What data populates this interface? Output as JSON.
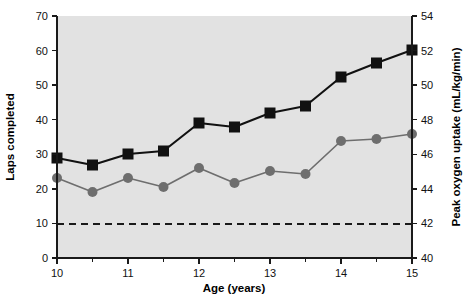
{
  "chart_data": {
    "type": "line",
    "title": "",
    "subtitle": "",
    "xlabel": "Age (years)",
    "ylabel": "Laps completed",
    "y2label": "Peak oxygen uptake (mL/kg/min)",
    "x": [
      10,
      10.5,
      11,
      11.5,
      12,
      12.5,
      13,
      13.5,
      14,
      14.5,
      15
    ],
    "xlim": [
      10,
      15
    ],
    "ylim": [
      0,
      70
    ],
    "y2lim": [
      40,
      54
    ],
    "xticks": [
      10,
      11,
      12,
      13,
      14,
      15
    ],
    "xticklabels": [
      "10",
      "11",
      "12",
      "13",
      "14",
      "15"
    ],
    "xminorticks": [
      10.5,
      11.5,
      12.5,
      13.5,
      14.5
    ],
    "yticks": [
      0,
      10,
      20,
      30,
      40,
      50,
      60,
      70
    ],
    "yticklabels": [
      "0",
      "10",
      "20",
      "30",
      "40",
      "50",
      "60",
      "70"
    ],
    "y2ticks": [
      40,
      42,
      44,
      46,
      48,
      50,
      52,
      54
    ],
    "y2ticklabels": [
      "40",
      "42",
      "44",
      "46",
      "48",
      "50",
      "52",
      "54"
    ],
    "grid": false,
    "legend": "none",
    "plot_background": "#e2e2e2",
    "series": [
      {
        "name": "Laps completed",
        "axis": "left",
        "marker": "square",
        "color": "#111111",
        "values": [
          29,
          27,
          30,
          31,
          39,
          38,
          42,
          44,
          52.5,
          56.5,
          60
        ]
      },
      {
        "name": "Peak oxygen uptake",
        "axis": "right",
        "marker": "circle",
        "color": "#6e6e6e",
        "values": [
          43.9,
          43.1,
          43.9,
          43.4,
          44.5,
          43.6,
          44.3,
          44.1,
          46.0,
          46.1,
          46.4
        ]
      }
    ],
    "reference_line": {
      "name": "threshold",
      "axis": "right",
      "value": 42,
      "left_axis_value": 9.3,
      "style": "dashed",
      "color": "#1a1a1a"
    }
  }
}
